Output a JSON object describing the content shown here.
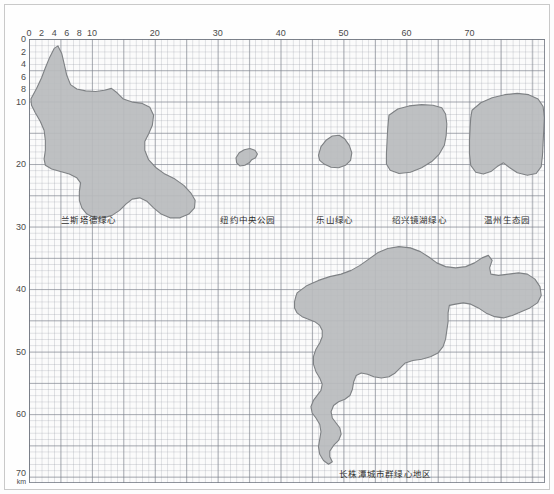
{
  "figure": {
    "unit_label": "km",
    "background_color": "#fbfbfb",
    "shape_fill": "#b9bbbd",
    "shape_stroke": "#7e8184",
    "grid_major_color": "#787d87",
    "grid_minor_color": "#969ba5"
  },
  "chart_data": {
    "type": "area",
    "title": "",
    "subtitle": "",
    "xlabel": "km",
    "ylabel": "km",
    "xlim": [
      0,
      82
    ],
    "ylim": [
      0,
      71
    ],
    "grid": true,
    "grid_minor_step": 1,
    "grid_major_step": 5,
    "legend_position": "inline-captions",
    "x_ticks": [
      0,
      2,
      4,
      6,
      8,
      10,
      20,
      30,
      40,
      50,
      60,
      70
    ],
    "x_tick_labels": [
      "0",
      "2",
      "4",
      "6",
      "8",
      "10",
      "20",
      "30",
      "40",
      "50",
      "60",
      "70"
    ],
    "y_ticks": [
      0,
      2,
      4,
      6,
      8,
      10,
      20,
      30,
      40,
      50,
      60,
      70
    ],
    "y_tick_labels": [
      "0",
      "2",
      "4",
      "6",
      "8",
      "10",
      "20",
      "30",
      "40",
      "50",
      "60",
      "70"
    ],
    "series": [
      {
        "name": "兰斯塔德绿心",
        "label": "兰斯塔德绿心",
        "label_x": 9.5,
        "label_y": 28.6,
        "approx_extent_km": {
          "x_min": 0.0,
          "x_max": 27.0,
          "y_min": 1.0,
          "y_max": 29.0
        },
        "points": [
          [
            0.3,
            9.6
          ],
          [
            1.2,
            7.9
          ],
          [
            2.0,
            6.2
          ],
          [
            2.6,
            4.6
          ],
          [
            3.3,
            2.9
          ],
          [
            4.0,
            1.5
          ],
          [
            4.6,
            1.1
          ],
          [
            5.2,
            2.3
          ],
          [
            5.6,
            4.0
          ],
          [
            6.0,
            5.8
          ],
          [
            6.6,
            7.3
          ],
          [
            7.6,
            8.0
          ],
          [
            9.0,
            8.3
          ],
          [
            10.6,
            8.4
          ],
          [
            12.0,
            8.2
          ],
          [
            13.1,
            7.9
          ],
          [
            14.0,
            8.6
          ],
          [
            15.0,
            9.6
          ],
          [
            16.5,
            10.1
          ],
          [
            18.0,
            10.3
          ],
          [
            19.2,
            10.9
          ],
          [
            19.8,
            12.2
          ],
          [
            19.6,
            13.8
          ],
          [
            19.0,
            15.2
          ],
          [
            18.4,
            16.4
          ],
          [
            18.4,
            17.8
          ],
          [
            19.0,
            19.3
          ],
          [
            20.2,
            20.6
          ],
          [
            21.6,
            21.6
          ],
          [
            23.2,
            22.4
          ],
          [
            24.6,
            23.4
          ],
          [
            25.7,
            24.6
          ],
          [
            26.4,
            25.8
          ],
          [
            26.3,
            27.0
          ],
          [
            25.4,
            28.0
          ],
          [
            24.0,
            28.6
          ],
          [
            22.4,
            28.6
          ],
          [
            21.0,
            28.0
          ],
          [
            19.8,
            27.0
          ],
          [
            18.8,
            26.0
          ],
          [
            17.6,
            25.4
          ],
          [
            16.4,
            25.6
          ],
          [
            15.4,
            26.4
          ],
          [
            14.4,
            27.4
          ],
          [
            13.2,
            28.2
          ],
          [
            11.8,
            28.6
          ],
          [
            10.4,
            28.6
          ],
          [
            9.2,
            28.0
          ],
          [
            8.4,
            27.0
          ],
          [
            8.0,
            25.8
          ],
          [
            8.0,
            24.4
          ],
          [
            8.2,
            23.0
          ],
          [
            7.6,
            22.2
          ],
          [
            6.4,
            21.6
          ],
          [
            5.0,
            21.2
          ],
          [
            3.6,
            20.8
          ],
          [
            2.6,
            20.2
          ],
          [
            2.4,
            19.2
          ],
          [
            2.6,
            17.8
          ],
          [
            2.6,
            16.2
          ],
          [
            2.4,
            14.6
          ],
          [
            1.8,
            13.2
          ],
          [
            1.0,
            11.8
          ],
          [
            0.4,
            10.6
          ]
        ]
      },
      {
        "name": "纽约中央公园",
        "label": "纽约中央公园",
        "label_x": 34.8,
        "label_y": 28.6,
        "approx_extent_km": {
          "x_min": 32.6,
          "x_max": 36.4,
          "y_min": 17.4,
          "y_max": 20.4
        },
        "points": [
          [
            32.9,
            19.0
          ],
          [
            33.4,
            18.2
          ],
          [
            34.2,
            17.7
          ],
          [
            35.1,
            17.5
          ],
          [
            35.9,
            17.8
          ],
          [
            36.3,
            18.4
          ],
          [
            36.0,
            19.0
          ],
          [
            35.4,
            19.3
          ],
          [
            35.0,
            19.8
          ],
          [
            34.3,
            20.2
          ],
          [
            33.5,
            20.3
          ],
          [
            33.0,
            19.8
          ]
        ]
      },
      {
        "name": "乐山绿心",
        "label": "乐山绿心",
        "label_x": 48.6,
        "label_y": 28.6,
        "approx_extent_km": {
          "x_min": 45.6,
          "x_max": 51.4,
          "y_min": 15.4,
          "y_max": 20.6
        },
        "points": [
          [
            46.0,
            18.6
          ],
          [
            46.4,
            17.2
          ],
          [
            47.2,
            16.2
          ],
          [
            48.2,
            15.5
          ],
          [
            49.3,
            15.4
          ],
          [
            50.2,
            16.0
          ],
          [
            50.9,
            17.0
          ],
          [
            51.3,
            18.2
          ],
          [
            51.1,
            19.4
          ],
          [
            50.3,
            20.2
          ],
          [
            49.2,
            20.6
          ],
          [
            48.0,
            20.5
          ],
          [
            46.9,
            20.0
          ],
          [
            46.2,
            19.4
          ]
        ]
      },
      {
        "name": "绍兴镜湖绿心",
        "label": "绍兴镜湖绿心",
        "label_x": 62.0,
        "label_y": 28.6,
        "approx_extent_km": {
          "x_min": 56.6,
          "x_max": 66.6,
          "y_min": 10.4,
          "y_max": 21.6
        },
        "points": [
          [
            57.2,
            12.2
          ],
          [
            58.6,
            11.2
          ],
          [
            60.4,
            10.7
          ],
          [
            62.4,
            10.5
          ],
          [
            64.2,
            10.6
          ],
          [
            65.6,
            11.0
          ],
          [
            66.2,
            12.0
          ],
          [
            66.4,
            13.6
          ],
          [
            66.3,
            15.4
          ],
          [
            66.0,
            17.0
          ],
          [
            65.2,
            18.4
          ],
          [
            64.0,
            19.6
          ],
          [
            62.4,
            20.6
          ],
          [
            60.6,
            21.3
          ],
          [
            58.8,
            21.5
          ],
          [
            57.4,
            21.0
          ],
          [
            56.8,
            20.0
          ],
          [
            56.8,
            18.4
          ],
          [
            56.9,
            16.4
          ],
          [
            57.0,
            14.4
          ]
        ]
      },
      {
        "name": "温州生态园",
        "label": "温州生态园",
        "label_x": 76.0,
        "label_y": 28.6,
        "approx_extent_km": {
          "x_min": 69.8,
          "x_max": 82.0,
          "y_min": 8.6,
          "y_max": 21.8
        },
        "points": [
          [
            70.4,
            11.4
          ],
          [
            71.8,
            10.2
          ],
          [
            73.6,
            9.4
          ],
          [
            75.6,
            8.9
          ],
          [
            77.6,
            8.7
          ],
          [
            79.4,
            8.9
          ],
          [
            80.9,
            9.6
          ],
          [
            81.7,
            10.8
          ],
          [
            81.9,
            12.6
          ],
          [
            81.8,
            14.6
          ],
          [
            81.7,
            16.6
          ],
          [
            81.6,
            18.6
          ],
          [
            81.4,
            20.4
          ],
          [
            80.6,
            21.5
          ],
          [
            79.2,
            21.8
          ],
          [
            77.6,
            21.4
          ],
          [
            76.4,
            20.6
          ],
          [
            75.4,
            19.8
          ],
          [
            74.4,
            20.4
          ],
          [
            73.4,
            21.2
          ],
          [
            72.2,
            21.6
          ],
          [
            71.0,
            21.3
          ],
          [
            70.2,
            20.2
          ],
          [
            70.0,
            18.4
          ],
          [
            70.0,
            16.2
          ],
          [
            70.1,
            14.2
          ],
          [
            70.2,
            12.6
          ]
        ]
      },
      {
        "name": "长株潭城市群绿心地区",
        "label": "长株潭城市群绿心地区",
        "label_x": 56.6,
        "label_y": 69.2,
        "approx_extent_km": {
          "x_min": 42.0,
          "x_max": 82.0,
          "y_min": 33.0,
          "y_max": 68.0
        },
        "points": [
          [
            42.6,
            40.6
          ],
          [
            44.2,
            39.4
          ],
          [
            46.0,
            38.6
          ],
          [
            47.8,
            38.0
          ],
          [
            49.6,
            37.6
          ],
          [
            51.2,
            37.0
          ],
          [
            52.6,
            36.2
          ],
          [
            54.0,
            35.2
          ],
          [
            55.4,
            34.2
          ],
          [
            57.0,
            33.5
          ],
          [
            58.8,
            33.2
          ],
          [
            60.6,
            33.4
          ],
          [
            62.2,
            34.0
          ],
          [
            63.6,
            34.9
          ],
          [
            64.8,
            35.8
          ],
          [
            66.2,
            36.4
          ],
          [
            67.8,
            36.6
          ],
          [
            69.4,
            36.4
          ],
          [
            70.8,
            35.8
          ],
          [
            72.0,
            35.0
          ],
          [
            73.0,
            34.6
          ],
          [
            73.6,
            35.4
          ],
          [
            73.2,
            36.6
          ],
          [
            73.4,
            37.6
          ],
          [
            74.6,
            37.8
          ],
          [
            76.2,
            37.6
          ],
          [
            77.8,
            37.4
          ],
          [
            79.2,
            37.6
          ],
          [
            80.4,
            38.4
          ],
          [
            81.2,
            39.6
          ],
          [
            81.4,
            41.0
          ],
          [
            80.8,
            42.2
          ],
          [
            79.6,
            43.0
          ],
          [
            78.2,
            43.6
          ],
          [
            76.8,
            44.2
          ],
          [
            75.4,
            44.6
          ],
          [
            74.0,
            44.4
          ],
          [
            72.6,
            43.8
          ],
          [
            71.4,
            43.0
          ],
          [
            70.2,
            42.4
          ],
          [
            69.0,
            42.2
          ],
          [
            67.8,
            42.4
          ],
          [
            66.8,
            42.6
          ],
          [
            66.6,
            43.8
          ],
          [
            66.6,
            45.2
          ],
          [
            66.4,
            46.6
          ],
          [
            66.2,
            48.0
          ],
          [
            65.8,
            49.2
          ],
          [
            65.0,
            50.2
          ],
          [
            63.8,
            50.8
          ],
          [
            62.4,
            51.2
          ],
          [
            61.0,
            51.4
          ],
          [
            59.8,
            51.8
          ],
          [
            59.0,
            52.6
          ],
          [
            58.2,
            53.4
          ],
          [
            57.2,
            54.0
          ],
          [
            56.0,
            54.2
          ],
          [
            54.8,
            54.0
          ],
          [
            53.8,
            53.6
          ],
          [
            52.8,
            53.4
          ],
          [
            52.0,
            53.8
          ],
          [
            51.6,
            54.8
          ],
          [
            51.4,
            56.0
          ],
          [
            51.0,
            57.0
          ],
          [
            50.2,
            57.6
          ],
          [
            49.2,
            58.0
          ],
          [
            48.4,
            58.6
          ],
          [
            48.0,
            59.6
          ],
          [
            48.2,
            60.6
          ],
          [
            48.8,
            61.4
          ],
          [
            49.4,
            62.2
          ],
          [
            49.6,
            63.2
          ],
          [
            49.2,
            64.2
          ],
          [
            48.4,
            65.0
          ],
          [
            47.8,
            65.9
          ],
          [
            47.8,
            66.8
          ],
          [
            48.2,
            67.6
          ],
          [
            47.6,
            68.0
          ],
          [
            46.8,
            67.4
          ],
          [
            46.2,
            66.4
          ],
          [
            46.0,
            65.2
          ],
          [
            46.2,
            64.0
          ],
          [
            46.4,
            62.8
          ],
          [
            46.2,
            61.6
          ],
          [
            45.6,
            60.6
          ],
          [
            45.0,
            59.8
          ],
          [
            44.8,
            58.8
          ],
          [
            45.2,
            57.8
          ],
          [
            45.8,
            57.0
          ],
          [
            46.4,
            56.2
          ],
          [
            46.6,
            55.2
          ],
          [
            46.2,
            54.2
          ],
          [
            45.6,
            53.2
          ],
          [
            45.2,
            52.0
          ],
          [
            45.2,
            50.8
          ],
          [
            45.6,
            49.6
          ],
          [
            46.2,
            48.6
          ],
          [
            46.6,
            47.6
          ],
          [
            46.6,
            46.6
          ],
          [
            46.2,
            45.8
          ],
          [
            45.4,
            45.2
          ],
          [
            44.4,
            44.8
          ],
          [
            43.4,
            44.4
          ],
          [
            42.6,
            43.8
          ],
          [
            42.2,
            43.0
          ],
          [
            42.2,
            42.0
          ],
          [
            42.4,
            41.2
          ]
        ]
      }
    ]
  }
}
